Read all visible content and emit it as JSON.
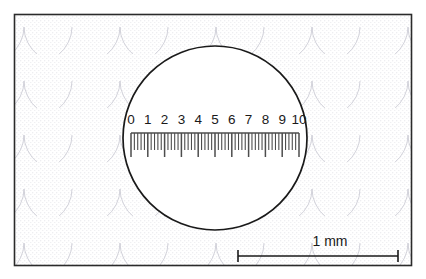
{
  "figure": {
    "title": "Microscope eyepiece graticule with calibrated scale",
    "background_color": "#ffffff",
    "border_color": "#2b2b2b",
    "texture": {
      "name": "stipple-scale-pattern",
      "dot_color": "#b9b9c4",
      "arc_color": "#c9c9d2",
      "description": "faint stippled dots with overlapping scalloped arcs"
    }
  },
  "eyepiece": {
    "name": "eyepiece-field-of-view",
    "fill_color": "#ffffff",
    "outline_color": "#1a1a1a",
    "center_x": 215,
    "center_y": 138,
    "radius": 92
  },
  "graticule": {
    "label": "graticule-scale",
    "tick_color": "#4d4d4d",
    "label_color": "#1a1a1a",
    "major_labels": [
      "0",
      "1",
      "2",
      "3",
      "4",
      "5",
      "6",
      "7",
      "8",
      "9",
      "10"
    ],
    "major_count": 11,
    "minor_per_division": 5,
    "start_x": 131,
    "end_x": 299,
    "labels_y": 124,
    "tick_top_y": 133,
    "tick_bottom_major_y": 157,
    "tick_bottom_minor_y": 150,
    "baseline_y": 133
  },
  "scale_bar": {
    "name": "scale-bar",
    "label": "1 mm",
    "label_x": 330,
    "label_y": 246,
    "bar_color": "#1a1a1a",
    "x_start": 238,
    "x_end": 398,
    "y": 256,
    "cap_height": 12
  },
  "chart_data": {
    "type": "table",
    "title": "Microscope eyepiece graticule with calibrated scale",
    "xlabel": "Graticule divisions",
    "ylabel": "",
    "categories": [
      "0",
      "1",
      "2",
      "3",
      "4",
      "5",
      "6",
      "7",
      "8",
      "9",
      "10"
    ],
    "values": [
      0,
      1,
      2,
      3,
      4,
      5,
      6,
      7,
      8,
      9,
      10
    ],
    "annotations": [
      "1 mm"
    ],
    "legend": []
  }
}
